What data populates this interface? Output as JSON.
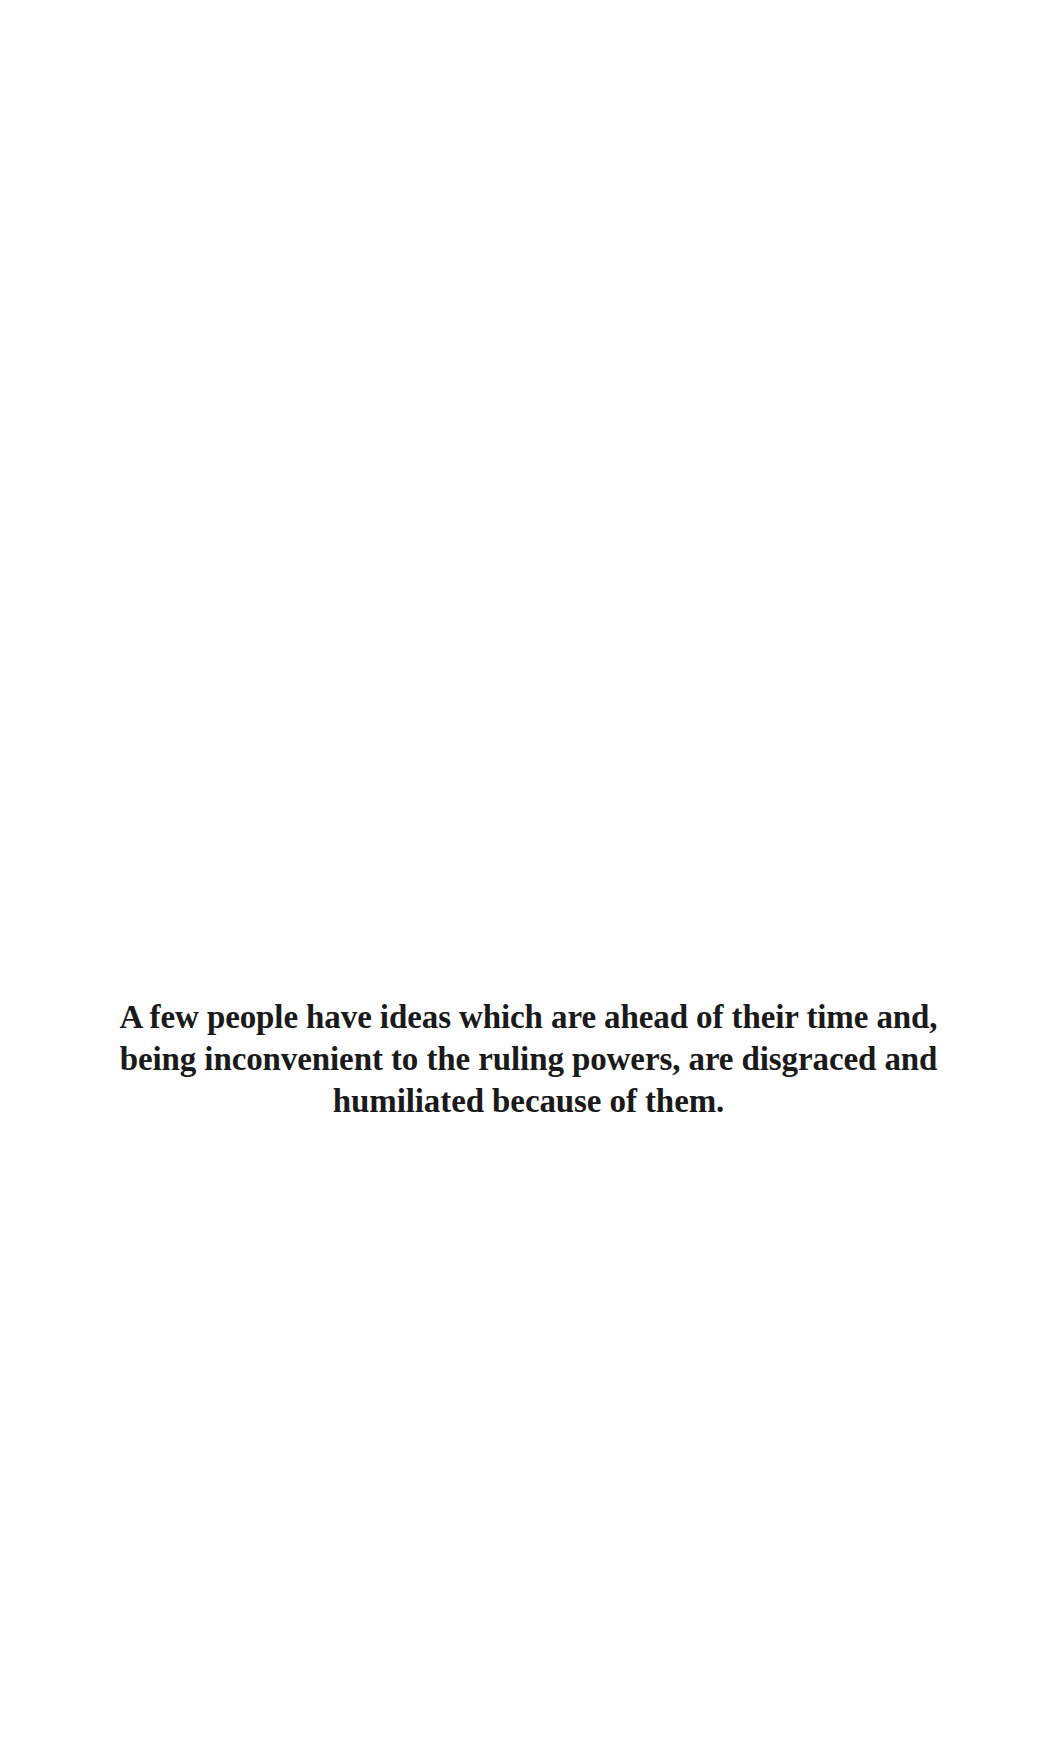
{
  "quote": {
    "lines": [
      "A few people have ideas which are ahead of their time and,",
      "being inconvenient to the ruling powers, are disgraced and",
      "humiliated because of them."
    ]
  },
  "colors": {
    "background": "#fefefe",
    "text": "#1a1a1a"
  }
}
